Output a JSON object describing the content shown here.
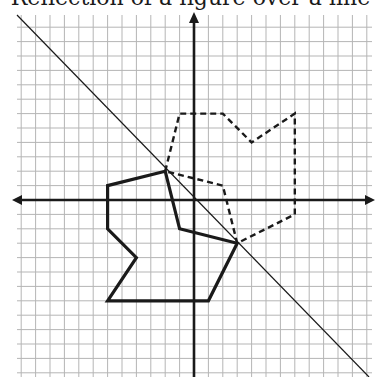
{
  "title": "Reflection of a figure over a line",
  "chart_data": {
    "type": "diagram",
    "title": "Reflection of a figure over a line",
    "grid": {
      "on": true,
      "unit": 1,
      "xlim": [
        -12,
        12
      ],
      "ylim": [
        -12,
        13
      ]
    },
    "axes": {
      "x_arrows": true,
      "y_arrows": true
    },
    "line_of_reflection": {
      "equation": "y = -x",
      "style": "thin solid"
    },
    "original_figure": {
      "style": "thick solid",
      "vertices": [
        [
          -2,
          2
        ],
        [
          -6,
          1
        ],
        [
          -6,
          -2
        ],
        [
          -4,
          -4
        ],
        [
          -6,
          -7
        ],
        [
          1,
          -7
        ],
        [
          3,
          -3
        ],
        [
          -1,
          -2
        ]
      ]
    },
    "reflected_figure": {
      "style": "thick dashed",
      "vertices": [
        [
          -2,
          2
        ],
        [
          -1,
          6
        ],
        [
          2,
          6
        ],
        [
          4,
          4
        ],
        [
          7,
          6
        ],
        [
          7,
          -1
        ],
        [
          3,
          -3
        ],
        [
          2,
          1
        ]
      ]
    }
  },
  "colors": {
    "ink": "#1a1a1a",
    "grid": "#b5b5b5",
    "background": "#ffffff"
  }
}
